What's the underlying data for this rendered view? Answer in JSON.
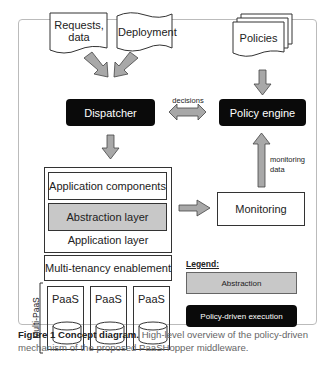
{
  "diagram": {
    "inputs": {
      "requests": "Requests,\ndata",
      "requests_line1": "Requests,",
      "requests_line2": "data",
      "deployment": "Deployment",
      "policies": "Policies"
    },
    "dispatcher": "Dispatcher",
    "policy_engine": "Policy engine",
    "decisions_label": "decisions",
    "monitoring_data_label_1": "monitoring",
    "monitoring_data_label_2": "data",
    "monitoring": "Monitoring",
    "app_stack": {
      "components": "Application components",
      "abstraction": "Abstraction layer",
      "layer_label": "Application layer",
      "multitenancy": "Multi-tenancy enablement",
      "multipaas_label": "Multi-PaaS",
      "paas": [
        "PaaS",
        "PaaS",
        "PaaS"
      ]
    },
    "legend": {
      "title": "Legend:",
      "abstraction": "Abstraction",
      "policy_driven": "Policy-driven execution"
    },
    "colors": {
      "black_box": "#0a0a0a",
      "gray_box": "#c8c8c8",
      "arrow_fill": "#a8a8a8"
    }
  },
  "caption": {
    "label": "Figure 1 Concept diagram.",
    "text": " High-level overview of the policy-driven mechanism of the proposed PaaSHopper middleware."
  }
}
